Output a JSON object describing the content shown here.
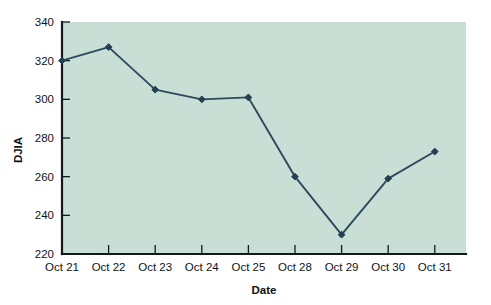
{
  "chart_data": {
    "type": "line",
    "title": "",
    "xlabel": "Date",
    "ylabel": "DJIA",
    "categories": [
      "Oct 21",
      "Oct 22",
      "Oct 23",
      "Oct 24",
      "Oct 25",
      "Oct 28",
      "Oct 29",
      "Oct 30",
      "Oct 31"
    ],
    "values": [
      320,
      327,
      305,
      300,
      301,
      260,
      230,
      259,
      273
    ],
    "series": [
      {
        "name": "DJIA",
        "values": [
          320,
          327,
          305,
          300,
          301,
          260,
          230,
          259,
          273
        ]
      }
    ],
    "ylim": [
      220,
      340
    ],
    "y_ticks": [
      220,
      240,
      260,
      280,
      300,
      320,
      340
    ],
    "y_tick_labels": [
      "220",
      "240",
      "260",
      "280",
      "300",
      "320",
      "340"
    ],
    "x_tick_labels": [
      "Oct 21",
      "Oct 22",
      "Oct 23",
      "Oct 24",
      "Oct 25",
      "Oct 28",
      "Oct 29",
      "Oct 30",
      "Oct 31"
    ],
    "grid": false,
    "legend": "none",
    "marker": "diamond",
    "colors": {
      "plot_background": "#c9ded4",
      "line": "#2b4a5e",
      "marker": "#243f52",
      "axis": "#121a1f",
      "text": "#101418",
      "page_background": "#ffffff"
    }
  }
}
